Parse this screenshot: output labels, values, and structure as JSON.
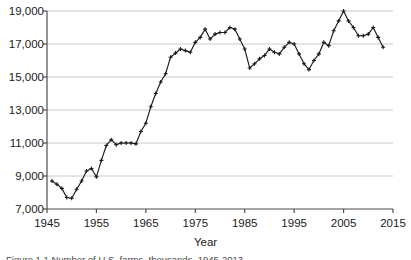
{
  "figure": {
    "background_color": "#ffffff",
    "line_color": "#1a1a1a",
    "grid_color": "#c9c9c9",
    "axis_color": "#4d4d4d",
    "text_color": "#1a1a1a",
    "caption_partial": "Figure 1.1 Number of U.S. farms, thousands, 1945-2013"
  },
  "chart_data": {
    "type": "line",
    "title": "",
    "subtitle": "",
    "xlabel": "Year",
    "ylabel": "",
    "xlim": [
      1945,
      2015
    ],
    "ylim": [
      7000,
      19000
    ],
    "grid": true,
    "legend": null,
    "marker": "plus",
    "xticks": [
      1945,
      1955,
      1965,
      1975,
      1985,
      1995,
      2005,
      2015
    ],
    "xtick_labels": [
      "1945",
      "1955",
      "1965",
      "1975",
      "1985",
      "1995",
      "2005",
      "2015"
    ],
    "yticks": [
      7000,
      9000,
      11000,
      13000,
      15000,
      17000,
      19000
    ],
    "ytick_labels": [
      "7,000",
      "9,000",
      "11,000",
      "13,000",
      "15,000",
      "17,000",
      "19,000"
    ],
    "series": [
      {
        "name": "series-1",
        "x": [
          1946,
          1947,
          1948,
          1949,
          1950,
          1951,
          1952,
          1953,
          1954,
          1955,
          1956,
          1957,
          1958,
          1959,
          1960,
          1961,
          1962,
          1963,
          1964,
          1965,
          1966,
          1967,
          1968,
          1969,
          1970,
          1971,
          1972,
          1973,
          1974,
          1975,
          1976,
          1977,
          1978,
          1979,
          1980,
          1981,
          1982,
          1983,
          1984,
          1985,
          1986,
          1987,
          1988,
          1989,
          1990,
          1991,
          1992,
          1993,
          1994,
          1995,
          1996,
          1997,
          1998,
          1999,
          2000,
          2001,
          2002,
          2003,
          2004,
          2005,
          2006,
          2007,
          2008,
          2009,
          2010,
          2011,
          2012,
          2013
        ],
        "values": [
          8700,
          8500,
          8250,
          7700,
          7650,
          8200,
          8700,
          9300,
          9450,
          8950,
          9950,
          10850,
          11200,
          10900,
          11000,
          11000,
          11000,
          10950,
          11700,
          12200,
          13200,
          14000,
          14700,
          15200,
          16200,
          16450,
          16700,
          16600,
          16500,
          17100,
          17400,
          17900,
          17300,
          17600,
          17700,
          17700,
          18000,
          17900,
          17300,
          16700,
          15550,
          15800,
          16100,
          16300,
          16700,
          16500,
          16400,
          16800,
          17100,
          17000,
          16400,
          15800,
          15450,
          16000,
          16400,
          17100,
          16900,
          17800,
          18400,
          19000,
          18400,
          18000,
          17500,
          17500,
          17600,
          18000,
          17400,
          16800
        ]
      }
    ]
  }
}
